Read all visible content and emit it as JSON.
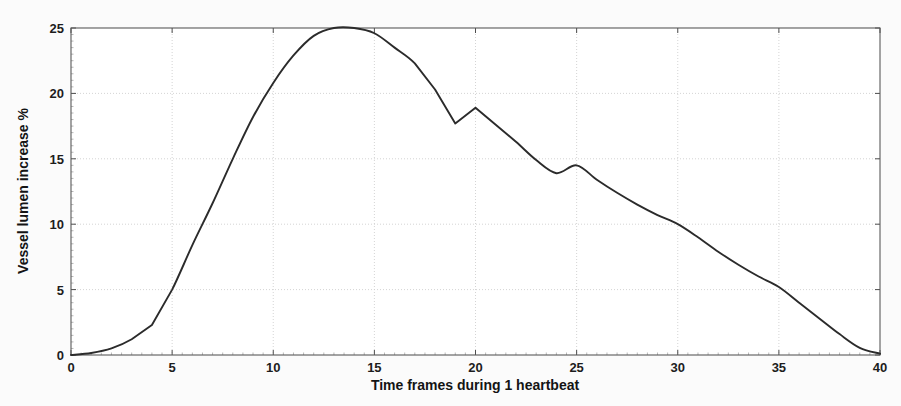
{
  "chart_data": {
    "type": "line",
    "title": "",
    "xlabel": "Time frames during 1 heartbeat",
    "ylabel": "Vessel lumen increase %",
    "xlim": [
      0,
      40
    ],
    "ylim": [
      0,
      25
    ],
    "xticks": [
      0,
      5,
      10,
      15,
      20,
      25,
      30,
      35,
      40
    ],
    "yticks": [
      0,
      5,
      10,
      15,
      20,
      25
    ],
    "xtick_labels": [
      "0",
      "5",
      "10",
      "15",
      "20",
      "25",
      "30",
      "35",
      "40"
    ],
    "ytick_labels": [
      "0",
      "5",
      "10",
      "15",
      "20",
      "25"
    ],
    "grid": true,
    "grid_style": "dotted",
    "legend": "none",
    "series": [
      {
        "name": "Vessel lumen increase",
        "color": "#2b2b2b",
        "x": [
          0,
          1,
          2,
          3,
          4,
          5,
          6,
          7,
          8,
          9,
          10,
          11,
          12,
          13,
          14,
          15,
          16,
          17,
          18,
          19,
          20,
          21,
          22,
          23,
          24,
          25,
          26,
          27,
          28,
          29,
          30,
          31,
          32,
          33,
          34,
          35,
          36,
          37,
          38,
          39,
          40
        ],
        "y": [
          0.0,
          0.15,
          0.5,
          1.2,
          2.3,
          5.0,
          8.4,
          11.6,
          15.0,
          18.2,
          20.8,
          22.9,
          24.4,
          25.0,
          25.0,
          24.6,
          23.5,
          22.3,
          20.3,
          17.7,
          18.9,
          17.6,
          16.3,
          14.9,
          13.9,
          14.5,
          13.4,
          12.4,
          11.5,
          10.7,
          10.0,
          9.0,
          7.9,
          6.9,
          6.0,
          5.2,
          4.0,
          2.8,
          1.6,
          0.55,
          0.1
        ]
      }
    ]
  },
  "axes": {
    "x_axis_title": "Time frames during 1 heartbeat",
    "y_axis_title": "Vessel lumen increase %"
  },
  "colors": {
    "curve": "#2b2b2b",
    "grid": "#cfcfcf",
    "frame": "#5a5a5a",
    "background": "#fbfbfb",
    "text": "#141414"
  }
}
